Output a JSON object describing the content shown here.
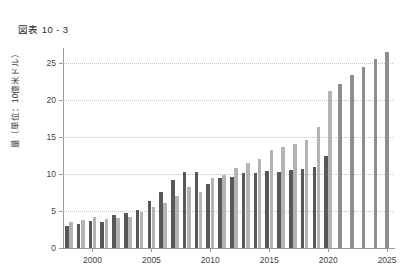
{
  "figure": {
    "title": "図表 10 - 3"
  },
  "axes": {
    "y_title": "量（単位：10億米ドル）",
    "y_ticks": [
      "0",
      "5",
      "10",
      "15",
      "20",
      "25"
    ],
    "x_ticks": [
      "2000",
      "2005",
      "2010",
      "2015",
      "2020",
      "2025"
    ]
  },
  "chart_data": {
    "type": "bar",
    "title": "図表 10 - 3",
    "xlabel": "",
    "ylabel": "量（単位：10億米ドル）",
    "ylim": [
      0,
      27
    ],
    "yticks": [
      0,
      5,
      10,
      15,
      20,
      25
    ],
    "grid": true,
    "legend": "none",
    "categories": [
      "1998",
      "1999",
      "2000",
      "2001",
      "2002",
      "2003",
      "2004",
      "2005",
      "2006",
      "2007",
      "2008",
      "2009",
      "2010",
      "2011",
      "2012",
      "2013",
      "2014",
      "2015",
      "2016",
      "2017",
      "2018",
      "2019",
      "2020",
      "2021",
      "2022",
      "2023",
      "2024",
      "2025"
    ],
    "series": [
      {
        "name": "系列1",
        "color": "#585858",
        "values": [
          3.0,
          3.2,
          3.6,
          3.5,
          4.4,
          4.7,
          5.1,
          6.4,
          7.5,
          9.2,
          10.2,
          10.2,
          8.6,
          9.4,
          9.6,
          10.1,
          10.1,
          10.4,
          10.2,
          10.5,
          10.7,
          11.0,
          12.4,
          null,
          null,
          null,
          null,
          null
        ]
      },
      {
        "name": "系列2",
        "color": "#b3b3b3",
        "values": [
          3.5,
          3.8,
          4.2,
          3.9,
          4.0,
          4.2,
          4.9,
          5.6,
          6.1,
          7.0,
          8.2,
          7.6,
          9.5,
          9.8,
          10.8,
          11.5,
          12.0,
          13.2,
          13.6,
          14.0,
          14.6,
          16.3,
          21.2,
          null,
          null,
          null,
          null,
          null
        ]
      },
      {
        "name": "予測",
        "color": "#8d8d8d",
        "values": [
          null,
          null,
          null,
          null,
          null,
          null,
          null,
          null,
          null,
          null,
          null,
          null,
          null,
          null,
          null,
          null,
          null,
          null,
          null,
          null,
          null,
          null,
          null,
          22.2,
          23.4,
          24.4,
          25.5,
          26.4
        ]
      }
    ]
  }
}
